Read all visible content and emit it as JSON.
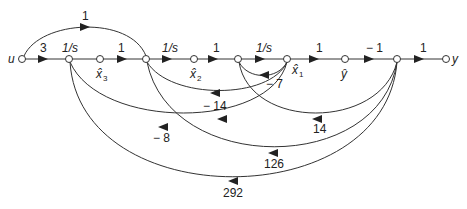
{
  "diagram": {
    "type": "signal-flow-graph",
    "nodes": [
      {
        "id": "u",
        "label": "u",
        "x": 22,
        "y": 59
      },
      {
        "id": "n1",
        "label": "",
        "x": 69,
        "y": 59
      },
      {
        "id": "x3",
        "label": "x̂",
        "sub": "3",
        "x": 100,
        "y": 59
      },
      {
        "id": "n3",
        "label": "",
        "x": 146,
        "y": 59
      },
      {
        "id": "x2",
        "label": "x̂",
        "sub": "2",
        "x": 194,
        "y": 59
      },
      {
        "id": "n5",
        "label": "",
        "x": 238,
        "y": 59
      },
      {
        "id": "x1",
        "label": "x̂",
        "sub": "1",
        "x": 287,
        "y": 59
      },
      {
        "id": "yh",
        "label": "ŷ",
        "x": 345,
        "y": 59
      },
      {
        "id": "n8",
        "label": "",
        "x": 397,
        "y": 59
      },
      {
        "id": "y",
        "label": "y",
        "x": 446,
        "y": 59
      }
    ],
    "forward_gains": {
      "u_n1": "3",
      "n1_x3": "1/s",
      "x3_n3": "1",
      "n3_x2": "1/s",
      "x2_n5": "1",
      "n5_x1": "1/s",
      "x1_yh": "1",
      "yh_n8": "− 1",
      "n8_y": "1",
      "u_n3_feedforward": "1"
    },
    "feedback_gains": {
      "x1_n5": "− 7",
      "x1_n3": "− 14",
      "x1_n1": "− 8",
      "n8_n5": "14",
      "n8_n3": "126",
      "n8_n1": "292"
    },
    "node_labels": {
      "u": "u",
      "y": "y",
      "x3": "x̂",
      "x3_sub": "3",
      "x2": "x̂",
      "x2_sub": "2",
      "x1": "x̂",
      "x1_sub": "1",
      "yh": "ŷ"
    }
  }
}
